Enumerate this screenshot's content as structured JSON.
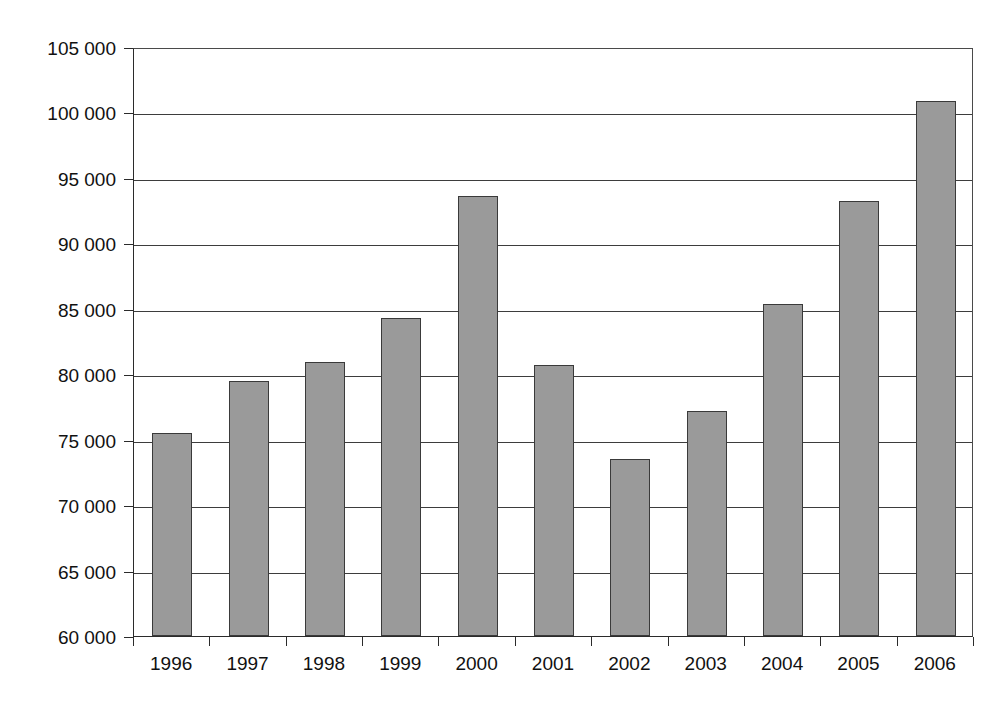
{
  "chart_data": {
    "type": "bar",
    "title": "",
    "subtitle": "",
    "xlabel": "",
    "ylabel": "USD Million",
    "categories": [
      "1996",
      "1997",
      "1998",
      "1999",
      "2000",
      "2001",
      "2002",
      "2003",
      "2004",
      "2005",
      "2006"
    ],
    "values": [
      75500,
      79500,
      80900,
      84300,
      93600,
      80700,
      73500,
      77200,
      85400,
      93200,
      100900
    ],
    "series": [
      {
        "name": "USD Million",
        "values": [
          75500,
          79500,
          80900,
          84300,
          93600,
          80700,
          73500,
          77200,
          85400,
          93200,
          100900
        ]
      }
    ],
    "ylim": [
      60000,
      105000
    ],
    "ytick_step": 5000,
    "ytick_values": [
      105000,
      100000,
      95000,
      90000,
      85000,
      80000,
      75000,
      70000,
      65000,
      60000
    ],
    "ytick_labels": [
      "105 000",
      "100 000",
      "95 000",
      "90 000",
      "85 000",
      "80 000",
      "75 000",
      "70 000",
      "65 000",
      "60 000"
    ],
    "grid": true,
    "grid_orientation": "horizontal",
    "legend": false,
    "legend_position": "none",
    "bar_color": "#9a9a9a",
    "bar_edge_color": "#3a3a3a",
    "gridline_color": "#3d3d3d",
    "axis_color": "#2b2b2b",
    "background_color": "#ffffff",
    "annotations": []
  }
}
